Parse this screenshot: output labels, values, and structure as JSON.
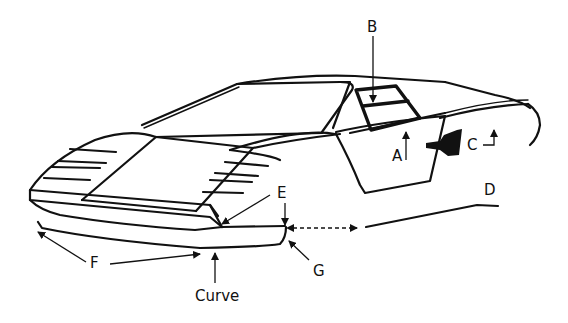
{
  "diagram": {
    "labels": {
      "A": "A",
      "B": "B",
      "C": "C",
      "D": "D",
      "E": "E",
      "F": "F",
      "G": "G",
      "curve": "Curve"
    },
    "colors": {
      "line": "#111111",
      "background": "#ffffff"
    }
  }
}
